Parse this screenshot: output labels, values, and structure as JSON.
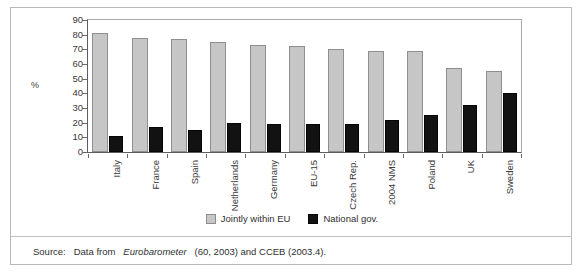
{
  "chart_data": {
    "type": "bar",
    "title": "",
    "xlabel": "",
    "ylabel": "%",
    "ylim": [
      0,
      90
    ],
    "ytick_step": 10,
    "yticks": [
      90,
      80,
      70,
      60,
      50,
      40,
      30,
      20,
      10,
      0
    ],
    "grid": false,
    "legend_position": "bottom-center",
    "categories": [
      "Italy",
      "France",
      "Spain",
      "Netherlands",
      "Germany",
      "EU-15",
      "Czech Rep.",
      "2004 NMS",
      "Poland",
      "UK",
      "Sweden"
    ],
    "series": [
      {
        "name": "Jointly within EU",
        "color": "#c6c6c6",
        "values": [
          81,
          78,
          77,
          75,
          73,
          72,
          70,
          69,
          69,
          57,
          55
        ]
      },
      {
        "name": "National gov.",
        "color": "#121212",
        "values": [
          11,
          17,
          15,
          20,
          19,
          19,
          19,
          22,
          25,
          32,
          40
        ]
      }
    ]
  },
  "legend": {
    "entries": [
      {
        "label": "Jointly within EU",
        "swatch": "gray-square-icon"
      },
      {
        "label": "National gov.",
        "swatch": "black-square-icon"
      }
    ]
  },
  "source": {
    "prefix": "Source:",
    "text_before_italic": "Data from",
    "italic_title": "Eurobarometer",
    "text_after_italic": "(60, 2003) and CCEB (2003.4)."
  }
}
